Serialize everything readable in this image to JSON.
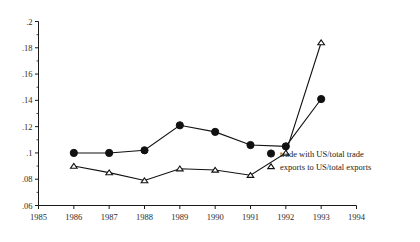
{
  "chart_data": {
    "type": "line",
    "title": "",
    "subtitle": "",
    "xlabel": "",
    "ylabel": "",
    "x": [
      1986,
      1987,
      1988,
      1989,
      1990,
      1991,
      1992,
      1993
    ],
    "xlim": [
      1985,
      1994
    ],
    "ylim": [
      0.06,
      0.2
    ],
    "xticks": [
      1985,
      1986,
      1987,
      1988,
      1989,
      1990,
      1991,
      1992,
      1993,
      1994
    ],
    "xticklabels": [
      "1985",
      "1986",
      "1987",
      "1988",
      "1989",
      "1990",
      "1991",
      "1992",
      "1993",
      "1994"
    ],
    "yticks": [
      0.06,
      0.08,
      0.1,
      0.12,
      0.14,
      0.16,
      0.18,
      0.2
    ],
    "yticklabels": [
      ".06",
      ".08",
      ".1",
      ".12",
      ".14",
      ".16",
      ".18",
      ".2"
    ],
    "y_minor_step": 0.01,
    "grid": false,
    "legend_position": "lower-right",
    "series": [
      {
        "name": "trade with US/total trade",
        "marker": "filled-circle",
        "values": [
          0.1,
          0.1,
          0.102,
          0.121,
          0.116,
          0.106,
          0.105,
          0.141
        ]
      },
      {
        "name": "exports to US/total exports",
        "marker": "open-triangle",
        "values": [
          0.09,
          0.085,
          0.079,
          0.088,
          0.087,
          0.083,
          0.1,
          0.184
        ]
      }
    ]
  },
  "legend": {
    "items": [
      {
        "label": "trade with US/total trade",
        "marker": "filled-circle"
      },
      {
        "label": "exports to US/total exports",
        "marker": "open-triangle"
      }
    ]
  },
  "colors": {
    "ink": "#111111",
    "axis": "#1a1a1a",
    "background": "#ffffff"
  }
}
